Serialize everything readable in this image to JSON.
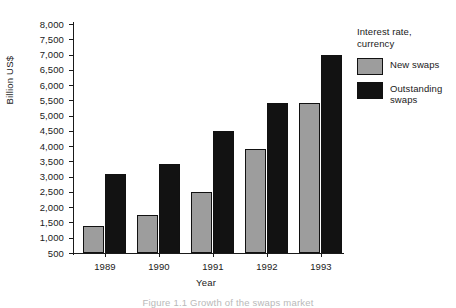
{
  "chart_data": {
    "type": "bar",
    "title": "",
    "xlabel": "Year",
    "ylabel": "Billion US$",
    "categories": [
      "1989",
      "1990",
      "1991",
      "1992",
      "1993"
    ],
    "series": [
      {
        "name": "New swaps",
        "color": "#9d9d9d",
        "values": [
          1400,
          1750,
          2500,
          3900,
          5400
        ]
      },
      {
        "name": "Outstanding swaps",
        "color": "#121212",
        "values": [
          3100,
          3400,
          4500,
          5400,
          7000
        ]
      }
    ],
    "ylim": [
      500,
      8000
    ],
    "ytick_step": 500,
    "yticks": [
      "8,000",
      "7,500",
      "7,000",
      "6,500",
      "6,000",
      "5,500",
      "5,000",
      "4,500",
      "4,000",
      "3,500",
      "3,000",
      "2,500",
      "2,000",
      "1,500",
      "1,000",
      "500"
    ],
    "grid": false,
    "legend_position": "right",
    "legend_title": "Interest rate, currency"
  },
  "legend": {
    "title_line1": "Interest rate,",
    "title_line2": "currency",
    "items": [
      {
        "label_line1": "New swaps",
        "label_line2": ""
      },
      {
        "label_line1": "Outstanding",
        "label_line2": "swaps"
      }
    ]
  },
  "caption": {
    "text": "Figure 1.1 Growth of the swaps market"
  }
}
